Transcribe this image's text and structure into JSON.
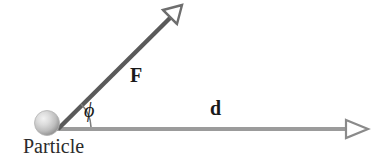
{
  "figure": {
    "kind": "physics-vector-diagram",
    "title_text": "",
    "background_color": "#ffffff",
    "canvas": {
      "width": 386,
      "height": 162
    }
  },
  "labels": {
    "force_vector": "F",
    "displacement_vector": "d",
    "angle_symbol": "ϕ",
    "particle": "Particle"
  },
  "colors": {
    "force_line": "#5a5a5a",
    "displacement_line": "#9b9b9b",
    "arrowhead_outline": "#6e6e6e",
    "arc": "#7a7a7a",
    "particle_fill_light": "#e8e8e8",
    "particle_fill_mid": "#c4c4c4",
    "particle_fill_dark": "#8f8f8f",
    "text": "#1a1a1a"
  },
  "geometry": {
    "origin": {
      "x": 57,
      "y": 129
    },
    "force_vector": {
      "from": {
        "x": 57,
        "y": 129
      },
      "to": {
        "x": 182,
        "y": 6
      },
      "angle_degrees": 45,
      "stroke_width": 4,
      "arrowhead": "hollow-triangle"
    },
    "displacement_vector": {
      "from": {
        "x": 57,
        "y": 129
      },
      "to": {
        "x": 369,
        "y": 129
      },
      "angle_degrees": 0,
      "stroke_width": 4,
      "arrowhead": "hollow-triangle"
    },
    "angle_arc": {
      "center": {
        "x": 57,
        "y": 129
      },
      "radius": 32,
      "start_degrees": 0,
      "end_degrees": 45
    },
    "particle": {
      "center": {
        "x": 47,
        "y": 123
      },
      "radius": 12
    }
  }
}
